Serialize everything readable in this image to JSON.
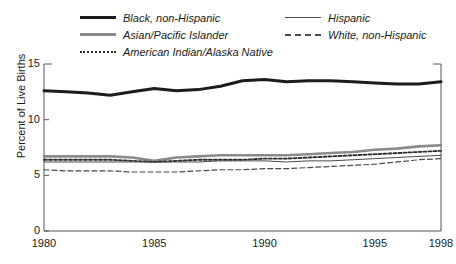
{
  "chart_data": {
    "type": "line",
    "title": "",
    "subtitle": "",
    "xlabel": "",
    "ylabel": "Percent of Live Births",
    "xlim": [
      1980,
      1998
    ],
    "ylim": [
      0,
      15
    ],
    "yticks": [
      0,
      5,
      10,
      15
    ],
    "xticks": [
      1980,
      1985,
      1990,
      1995,
      1998
    ],
    "grid": false,
    "legend_position": "top",
    "x": [
      1980,
      1981,
      1982,
      1983,
      1984,
      1985,
      1986,
      1987,
      1988,
      1989,
      1990,
      1991,
      1992,
      1993,
      1994,
      1995,
      1996,
      1997,
      1998
    ],
    "series": [
      {
        "name": "Black, non-Hispanic",
        "style": "solid-thick",
        "color": "#1c1c1c",
        "values": [
          12.6,
          12.5,
          12.4,
          12.2,
          12.5,
          12.8,
          12.6,
          12.7,
          13.0,
          13.5,
          13.6,
          13.4,
          13.5,
          13.5,
          13.4,
          13.3,
          13.2,
          13.2,
          13.4
        ]
      },
      {
        "name": "Asian/Pacific Islander",
        "style": "solid-medium",
        "color": "#8a8a8a",
        "values": [
          6.7,
          6.7,
          6.7,
          6.7,
          6.6,
          6.3,
          6.6,
          6.7,
          6.8,
          6.8,
          6.8,
          6.8,
          6.9,
          7.0,
          7.1,
          7.3,
          7.4,
          7.6,
          7.7
        ]
      },
      {
        "name": "American Indian/Alaska Native",
        "style": "dotted",
        "color": "#2a2a2a",
        "values": [
          6.4,
          6.4,
          6.4,
          6.4,
          6.3,
          6.2,
          6.3,
          6.4,
          6.4,
          6.4,
          6.5,
          6.5,
          6.6,
          6.7,
          6.8,
          6.9,
          7.0,
          7.1,
          7.2
        ]
      },
      {
        "name": "Hispanic",
        "style": "solid-thin",
        "color": "#4a4a4a",
        "values": [
          6.2,
          6.2,
          6.2,
          6.2,
          6.2,
          6.2,
          6.2,
          6.2,
          6.3,
          6.3,
          6.3,
          6.2,
          6.3,
          6.3,
          6.4,
          6.5,
          6.6,
          6.7,
          6.8
        ]
      },
      {
        "name": "White, non-Hispanic",
        "style": "dashed",
        "color": "#4a4a4a",
        "values": [
          5.5,
          5.4,
          5.4,
          5.4,
          5.3,
          5.3,
          5.3,
          5.4,
          5.5,
          5.5,
          5.6,
          5.6,
          5.7,
          5.8,
          5.9,
          6.0,
          6.2,
          6.4,
          6.5
        ]
      }
    ]
  },
  "legend": {
    "left_column": [
      {
        "label": "Black, non-Hispanic",
        "swatch": "solid-thick-black"
      },
      {
        "label": "Asian/Pacific Islander",
        "swatch": "solid-medium-gray"
      },
      {
        "label": "American Indian/Alaska Native",
        "swatch": "dotted-black"
      }
    ],
    "right_column": [
      {
        "label": "Hispanic",
        "swatch": "solid-thin-gray"
      },
      {
        "label": "White, non-Hispanic",
        "swatch": "dashed-gray"
      }
    ]
  },
  "axes": {
    "ylabel": "Percent of Live Births",
    "ytick_labels": [
      "15",
      "10",
      "5",
      "0"
    ],
    "xtick_labels": [
      "1980",
      "1985",
      "1990",
      "1995",
      "1998"
    ]
  },
  "colors": {
    "black_series": "#1c1c1c",
    "gray_series": "#8a8a8a",
    "thin_series": "#4a4a4a",
    "axis": "#555555",
    "background": "#ffffff"
  }
}
